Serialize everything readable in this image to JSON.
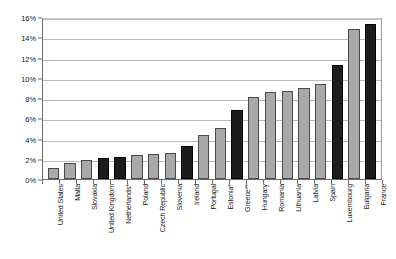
{
  "chart_data": {
    "type": "bar",
    "title": "",
    "xlabel": "",
    "ylabel": "",
    "ylim": [
      0,
      16
    ],
    "ytick_labels": [
      "0%",
      "2%",
      "4%",
      "6%",
      "8%",
      "10%",
      "12%",
      "14%",
      "16%"
    ],
    "ytick_values": [
      0,
      2,
      4,
      6,
      8,
      10,
      12,
      14,
      16
    ],
    "grid": true,
    "legend": "none",
    "axis_unit": "percent",
    "colors": {
      "gray_bar": "#a9a9a9",
      "black_bar": "#1c1c1c",
      "bar_outline": "#4a4a4a",
      "gridline": "#b9b9b9",
      "axis": "#6b6b6b",
      "background": "#ffffff",
      "text": "#1a1a1a"
    },
    "categories": [
      "United States",
      "Malta",
      "Slovakia",
      "United Kingdom",
      "Netherlands*",
      "Poland",
      "Czech Republic",
      "Slovenia",
      "Ireland",
      "Portugal",
      "Estonia*",
      "Greece**",
      "Hungary",
      "Romania",
      "Lithuania",
      "Latvia",
      "Spain",
      "Luxembourg",
      "Bulgaria",
      "France"
    ],
    "values": [
      1.1,
      1.6,
      1.9,
      2.1,
      2.2,
      2.4,
      2.5,
      2.6,
      3.3,
      4.3,
      5.0,
      6.8,
      8.1,
      8.6,
      8.7,
      9.0,
      9.4,
      11.3,
      14.8,
      15.3
    ],
    "bar_styles": [
      "gray",
      "gray",
      "gray",
      "black",
      "black",
      "gray",
      "gray",
      "gray",
      "black",
      "gray",
      "gray",
      "black",
      "gray",
      "gray",
      "gray",
      "gray",
      "gray",
      "black",
      "gray",
      "black"
    ]
  }
}
